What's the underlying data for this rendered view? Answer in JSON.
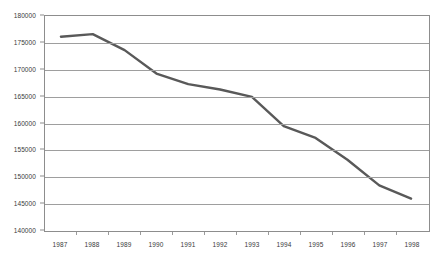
{
  "chart_data": {
    "type": "line",
    "title": "",
    "subtitle": "",
    "xlabel": "",
    "ylabel": "",
    "categories": [
      "1987",
      "1988",
      "1989",
      "1990",
      "1991",
      "1992",
      "1993",
      "1994",
      "1995",
      "1996",
      "1997",
      "1998"
    ],
    "series": [
      {
        "name": "Series 1",
        "color": "#595959",
        "values": [
          176100,
          176600,
          173600,
          169200,
          167200,
          166200,
          164800,
          159300,
          157100,
          153000,
          148200,
          145700
        ]
      }
    ],
    "ylim": [
      140000,
      180000
    ],
    "ytick_step": 5000,
    "ytick_labels": [
      "180000",
      "175000",
      "170000",
      "165000",
      "160000",
      "155000",
      "150000",
      "145000",
      "140000"
    ],
    "ytick_values": [
      180000,
      175000,
      170000,
      165000,
      160000,
      155000,
      150000,
      145000,
      140000
    ],
    "grid": true,
    "grid_axis": "y",
    "grid_color": "#9e9e9e",
    "legend": false,
    "legend_position": "none",
    "plot_border_color": "#8d8d8d",
    "background_color": "#ffffff",
    "line_width": 2.4,
    "markers": false
  }
}
